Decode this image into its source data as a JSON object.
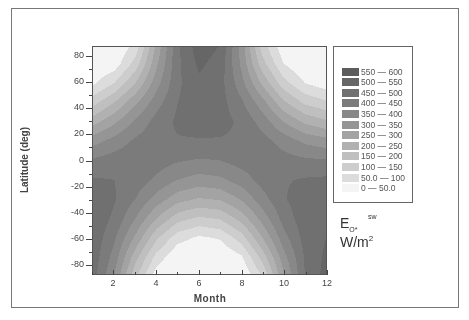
{
  "chart_data": {
    "type": "heatmap",
    "subtype": "filled-contour",
    "title": "",
    "xlabel": "Month",
    "ylabel": "Latitude (deg)",
    "xlim": [
      1,
      12
    ],
    "ylim": [
      -90,
      90
    ],
    "x_ticks": [
      2,
      4,
      6,
      8,
      10,
      12
    ],
    "y_ticks": [
      80,
      60,
      40,
      20,
      0,
      -20,
      -40,
      -60,
      -80
    ],
    "colorbar_label": "E_O* ^sw  W/m^2",
    "levels": [
      {
        "label": "550  —  600",
        "min": 550,
        "max": 600,
        "color": "#5c5c5c"
      },
      {
        "label": "500  —  550",
        "min": 500,
        "max": 550,
        "color": "#666666"
      },
      {
        "label": "450  —  500",
        "min": 450,
        "max": 500,
        "color": "#707070"
      },
      {
        "label": "400  —  450",
        "min": 400,
        "max": 450,
        "color": "#7b7b7b"
      },
      {
        "label": "350  —  400",
        "min": 350,
        "max": 400,
        "color": "#888888"
      },
      {
        "label": "300  —  350",
        "min": 300,
        "max": 350,
        "color": "#959595"
      },
      {
        "label": "250  —  300",
        "min": 250,
        "max": 300,
        "color": "#a3a3a3"
      },
      {
        "label": "200  —  250",
        "min": 200,
        "max": 250,
        "color": "#b1b1b1"
      },
      {
        "label": "150  —  200",
        "min": 150,
        "max": 200,
        "color": "#bfbfbf"
      },
      {
        "label": "100  —  150",
        "min": 100,
        "max": 150,
        "color": "#cdcdcd"
      },
      {
        "label": "50.0  —  100",
        "min": 50,
        "max": 100,
        "color": "#dcdcdc"
      },
      {
        "label": "0  —  50.0",
        "min": 0,
        "max": 50,
        "color": "#f4f4f4"
      }
    ],
    "grid": {
      "months": [
        1,
        2,
        3,
        4,
        5,
        6,
        7,
        8,
        9,
        10,
        11,
        12
      ],
      "latitudes": [
        90,
        75,
        60,
        45,
        30,
        15,
        0,
        -15,
        -30,
        -45,
        -60,
        -75,
        -90
      ],
      "values": [
        [
          0,
          0,
          60,
          260,
          440,
          530,
          500,
          330,
          120,
          10,
          0,
          0
        ],
        [
          0,
          20,
          120,
          290,
          440,
          510,
          480,
          340,
          170,
          50,
          0,
          0
        ],
        [
          40,
          100,
          200,
          330,
          440,
          490,
          470,
          370,
          240,
          120,
          50,
          20
        ],
        [
          130,
          200,
          290,
          380,
          450,
          480,
          470,
          410,
          320,
          210,
          140,
          110
        ],
        [
          230,
          290,
          360,
          420,
          460,
          475,
          470,
          440,
          380,
          300,
          240,
          210
        ],
        [
          330,
          370,
          410,
          435,
          445,
          445,
          445,
          440,
          420,
          380,
          340,
          320
        ],
        [
          410,
          425,
          435,
          425,
          405,
          395,
          400,
          420,
          430,
          420,
          410,
          405
        ],
        [
          455,
          450,
          430,
          390,
          350,
          330,
          340,
          375,
          420,
          445,
          455,
          460
        ],
        [
          480,
          455,
          400,
          330,
          270,
          245,
          255,
          305,
          380,
          445,
          480,
          490
        ],
        [
          490,
          440,
          350,
          250,
          170,
          140,
          155,
          220,
          320,
          420,
          480,
          500
        ],
        [
          485,
          410,
          290,
          160,
          70,
          40,
          55,
          125,
          250,
          380,
          470,
          500
        ],
        [
          480,
          380,
          220,
          80,
          5,
          0,
          0,
          40,
          170,
          330,
          455,
          510
        ],
        [
          470,
          350,
          160,
          20,
          0,
          0,
          0,
          0,
          100,
          290,
          450,
          520
        ]
      ]
    },
    "legend_position": "right",
    "grid_lines": false
  },
  "labels": {
    "y_title": "Latitude (deg)",
    "x_title": "Month",
    "unit_main": "E",
    "unit_sub": "O*",
    "unit_sup": "sw",
    "unit_line2": "W/m",
    "unit_line2_sup": "2"
  }
}
